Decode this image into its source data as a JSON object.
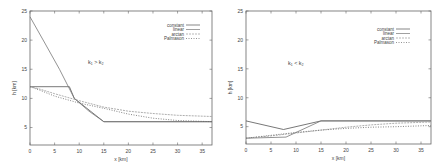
{
  "chart_data": [
    {
      "type": "line",
      "title": "",
      "annotation": "k1 > k2",
      "xlabel": "x [km]",
      "ylabel": "h [km]",
      "xlim": [
        0,
        37
      ],
      "ylim": [
        2,
        25
      ],
      "xticks": [
        0,
        5,
        10,
        15,
        20,
        25,
        30,
        35
      ],
      "yticks": [
        5,
        10,
        15,
        20,
        25
      ],
      "grid": false,
      "legend_position": "top-right",
      "series": [
        {
          "name": "constant",
          "x": [
            0,
            8,
            9,
            15,
            37
          ],
          "y": [
            12,
            12,
            10,
            6,
            6
          ]
        },
        {
          "name": "linear",
          "x": [
            0,
            3,
            6,
            9,
            12,
            15,
            37
          ],
          "y": [
            24,
            19.5,
            15,
            10,
            7.8,
            6,
            6
          ]
        },
        {
          "name": "arctan",
          "x": [
            0,
            2,
            5,
            10,
            15,
            20,
            25,
            30,
            37
          ],
          "y": [
            12,
            11.6,
            10.8,
            9.6,
            8.5,
            7.8,
            7.4,
            7.1,
            6.9
          ]
        },
        {
          "name": "Palmason",
          "x": [
            0,
            2,
            5,
            10,
            15,
            20,
            25,
            30,
            37
          ],
          "y": [
            12,
            11.4,
            10.4,
            9.2,
            8.3,
            7.3,
            6.6,
            6.2,
            6.0
          ]
        }
      ]
    },
    {
      "type": "line",
      "title": "",
      "annotation": "k1 < k2",
      "xlabel": "x [km]",
      "ylabel": "h [km]",
      "xlim": [
        0,
        37
      ],
      "ylim": [
        2,
        25
      ],
      "xticks": [
        0,
        5,
        10,
        15,
        20,
        25,
        30,
        35
      ],
      "yticks": [
        5,
        10,
        15,
        20,
        25
      ],
      "grid": false,
      "legend_position": "top-right",
      "series": [
        {
          "name": "constant",
          "x": [
            0,
            7.5,
            15,
            37
          ],
          "y": [
            6,
            4.5,
            6,
            6
          ]
        },
        {
          "name": "linear",
          "x": [
            0,
            8,
            15,
            37
          ],
          "y": [
            3,
            3.2,
            6,
            6
          ]
        },
        {
          "name": "arctan",
          "x": [
            0,
            5,
            10,
            15,
            20,
            25,
            30,
            37
          ],
          "y": [
            3,
            3.4,
            3.9,
            4.4,
            4.9,
            5.3,
            5.6,
            5.8
          ]
        },
        {
          "name": "Palmason",
          "x": [
            0,
            5,
            10,
            15,
            20,
            25,
            30,
            37
          ],
          "y": [
            3,
            3.5,
            4.0,
            4.4,
            4.7,
            4.9,
            5.0,
            5.2
          ]
        }
      ]
    }
  ],
  "panels": [
    {
      "annotation": "k₁ > k₂",
      "xlabel": "x [km]",
      "ylabel": "h [km]",
      "legend": [
        "constant",
        "linear",
        "arctan",
        "Palmason"
      ]
    },
    {
      "annotation": "k₁ < k₂",
      "xlabel": "x [km]",
      "ylabel": "h [km]",
      "legend": [
        "constant",
        "linear",
        "arctan",
        "Palmason"
      ]
    }
  ]
}
